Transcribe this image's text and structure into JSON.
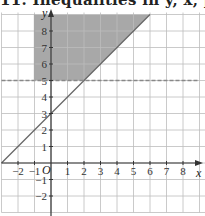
{
  "heading": "11. Inequalities in y, x, p",
  "chart_data": {
    "type": "line",
    "title": "",
    "xlabel": "x",
    "ylabel": "y",
    "origin_label": "O",
    "xlim": [
      -3,
      9
    ],
    "ylim": [
      -3,
      9
    ],
    "grid": true,
    "x_ticks": [
      "-2",
      "-1",
      "1",
      "2",
      "3",
      "4",
      "5",
      "6",
      "7",
      "8"
    ],
    "y_ticks": [
      "-2",
      "-1",
      "1",
      "2",
      "3",
      "4",
      "5",
      "6",
      "7",
      "8"
    ],
    "series": [
      {
        "name": "y = x + 3",
        "style": "solid",
        "x": [
          -3,
          6
        ],
        "y": [
          0,
          9
        ]
      },
      {
        "name": "y = 5",
        "style": "dashed",
        "x": [
          -3,
          9
        ],
        "y": [
          5,
          5
        ]
      },
      {
        "name": "x = -1",
        "style": "solid",
        "x": [
          -1,
          -1
        ],
        "y": [
          5,
          9
        ]
      }
    ],
    "shaded_region": {
      "description": "x >= -1, y >= 5, y >= x + 3",
      "vertices": [
        [
          -1,
          5
        ],
        [
          2,
          5
        ],
        [
          6,
          9
        ],
        [
          -1,
          9
        ]
      ],
      "color": "#a8a8a8"
    }
  },
  "colors": {
    "grid": "#bdbdbd",
    "axis": "#333333",
    "line": "#666666",
    "dashed": "#888888",
    "shade": "#a8a8a8"
  }
}
